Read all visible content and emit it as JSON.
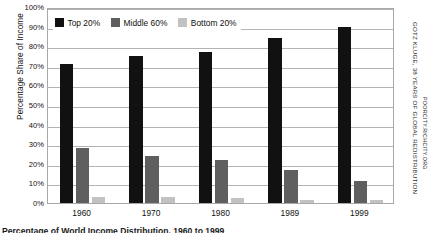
{
  "chart_data": {
    "type": "bar",
    "title": "",
    "xlabel": "",
    "ylabel": "Percentage Share of Income",
    "categories": [
      "1960",
      "1970",
      "1980",
      "1989",
      "1999"
    ],
    "ylim": [
      0,
      100
    ],
    "ytick_labels": [
      "100%",
      "90%",
      "80%",
      "70%",
      "60%",
      "50%",
      "40%",
      "30%",
      "20%",
      "10%",
      "0%"
    ],
    "ytick_values": [
      100,
      90,
      80,
      70,
      60,
      50,
      40,
      30,
      20,
      10,
      0
    ],
    "grid": true,
    "legend_position": "top-left-inside",
    "series": [
      {
        "name": "Top 20%",
        "color": "#111111",
        "values": [
          71,
          75,
          77,
          84,
          90
        ]
      },
      {
        "name": "Middle 60%",
        "color": "#5f5f5f",
        "values": [
          28,
          24,
          22,
          17,
          11
        ]
      },
      {
        "name": "Bottom 20%",
        "color": "#c2c2c2",
        "values": [
          3,
          3,
          2.5,
          1.5,
          1.5
        ]
      }
    ]
  },
  "credit": {
    "line1": "GOTZ KLUGE, 38 YEARS OF GLOBAL REDISTRIBUTION",
    "line2": "POORCITY.RICHCITY.ORG"
  },
  "caption": {
    "text": "Percentage of World Income Distribution, 1960 to 1999"
  }
}
